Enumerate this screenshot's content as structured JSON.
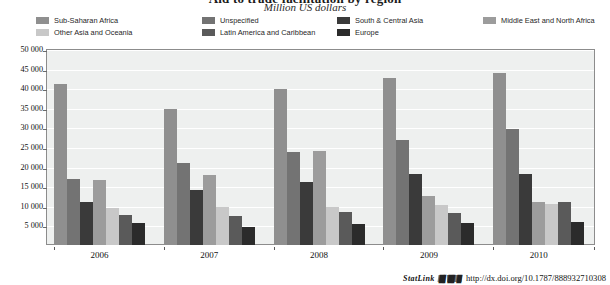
{
  "header": {
    "clipped_title": "Aid to trade facilitation by region",
    "subtitle": "Million US dollars"
  },
  "legend": {
    "columns": [
      {
        "left": 0,
        "items": [
          0,
          1
        ]
      },
      {
        "left": 166,
        "items": [
          2,
          3
        ]
      },
      {
        "left": 301,
        "items": [
          4,
          5
        ]
      },
      {
        "left": 447,
        "items": [
          6
        ]
      }
    ],
    "items": [
      {
        "label": "Sub-Saharan Africa",
        "color": "#8f8f8f"
      },
      {
        "label": "Other Asia and Oceania",
        "color": "#c8c8c8"
      },
      {
        "label": "Unspecified",
        "color": "#737373"
      },
      {
        "label": "Latin America and Caribbean",
        "color": "#5a5a5a"
      },
      {
        "label": "South & Central Asia",
        "color": "#3a3a3a"
      },
      {
        "label": "Europe",
        "color": "#2b2b2b"
      },
      {
        "label": "Middle East and North Africa",
        "color": "#9c9c9c"
      }
    ]
  },
  "statlink": {
    "word": "StatLink",
    "glyph": "glyph-barcode",
    "url": "http://dx.doi.org/10.1787/888932710308"
  },
  "chart_data": {
    "type": "bar",
    "title": "Aid to trade facilitation by region",
    "subtitle": "Million US dollars",
    "xlabel": "",
    "ylabel": "Million US dollars",
    "ylim": [
      0,
      50000
    ],
    "ytick_labels": [
      "50 000",
      "45 000",
      "40 000",
      "35 000",
      "30 000",
      "25 000",
      "20 000",
      "15 000",
      "10 000",
      "5 000"
    ],
    "ytick_values": [
      50000,
      45000,
      40000,
      35000,
      30000,
      25000,
      20000,
      15000,
      10000,
      5000
    ],
    "grid": true,
    "legend_position": "top",
    "categories": [
      "2006",
      "2007",
      "2008",
      "2009",
      "2010"
    ],
    "series": [
      {
        "name": "Sub-Saharan Africa",
        "color": "#8f8f8f",
        "values": [
          41000,
          34800,
          39700,
          42500,
          43800
        ]
      },
      {
        "name": "Unspecified",
        "color": "#737373",
        "values": [
          16800,
          20800,
          23800,
          26800,
          29500
        ]
      },
      {
        "name": "South & Central Asia",
        "color": "#3a3a3a",
        "values": [
          11000,
          14100,
          16000,
          18200,
          18200
        ]
      },
      {
        "name": "Middle East and North Africa",
        "color": "#9c9c9c",
        "values": [
          16700,
          17900,
          23900,
          12600,
          11100
        ]
      },
      {
        "name": "Other Asia and Oceania",
        "color": "#c8c8c8",
        "values": [
          9400,
          9700,
          9800,
          10200,
          10400
        ]
      },
      {
        "name": "Latin America and Caribbean",
        "color": "#5a5a5a",
        "values": [
          7700,
          7300,
          8500,
          8200,
          11000
        ]
      },
      {
        "name": "Europe",
        "color": "#2b2b2b",
        "values": [
          5600,
          4600,
          5300,
          5500,
          5900
        ]
      }
    ]
  }
}
